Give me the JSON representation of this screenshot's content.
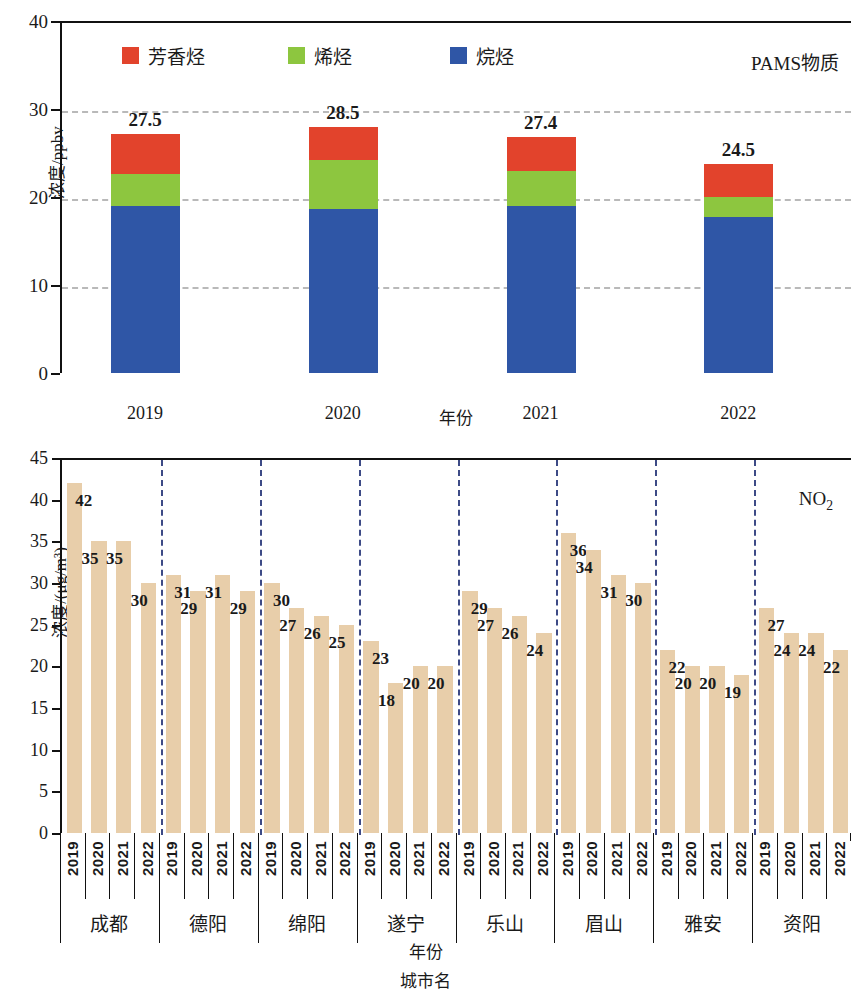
{
  "colors": {
    "aromatic": "#e2432c",
    "alkene": "#8dc63f",
    "alkane": "#2f56a6",
    "no2_bar": "#e8ceaa",
    "separator": "#3d4a86",
    "gridline": "#b9b9b9",
    "axis": "#111111"
  },
  "chart_data": [
    {
      "type": "bar",
      "subtype": "stacked",
      "title": "",
      "annotation": "PAMS物质",
      "xlabel": "年份",
      "ylabel": "浓度/ppbv",
      "ylim": [
        0,
        40
      ],
      "yticks": [
        0,
        10,
        20,
        30,
        40
      ],
      "ytick_labels": [
        "0",
        "10",
        "20",
        "30",
        "40"
      ],
      "grid": "horizontal dashed at 10, 20, 30",
      "legend_position": "top-left inside",
      "categories": [
        "2019",
        "2020",
        "2021",
        "2022"
      ],
      "series": [
        {
          "name": "烷烃",
          "color": "#2f56a6",
          "values": [
            19.0,
            18.6,
            19.0,
            17.7
          ]
        },
        {
          "name": "烯烃",
          "color": "#8dc63f",
          "values": [
            3.6,
            5.6,
            4.0,
            2.3
          ]
        },
        {
          "name": "芳香烃",
          "color": "#e2432c",
          "values": [
            4.6,
            3.8,
            3.8,
            3.8
          ]
        }
      ],
      "totals": [
        27.5,
        28.5,
        27.4,
        24.5
      ],
      "total_labels": [
        "27.5",
        "28.5",
        "27.4",
        "24.5"
      ]
    },
    {
      "type": "bar",
      "subtype": "grouped-by-city",
      "title": "",
      "annotation": "NO₂",
      "xlabel": "年份",
      "xlabel2": "城市名",
      "ylabel": "浓度/(μg/m³)",
      "ylim": [
        0,
        45
      ],
      "yticks": [
        0,
        5,
        10,
        15,
        20,
        25,
        30,
        35,
        40,
        45
      ],
      "ytick_labels": [
        "0",
        "5",
        "10",
        "15",
        "20",
        "25",
        "30",
        "35",
        "40",
        "45"
      ],
      "grid": "none",
      "years": [
        "2019",
        "2020",
        "2021",
        "2022"
      ],
      "cities": [
        "成都",
        "德阳",
        "绵阳",
        "遂宁",
        "乐山",
        "眉山",
        "雅安",
        "资阳"
      ],
      "groups": [
        {
          "city": "成都",
          "values": [
            42,
            35,
            35,
            30
          ],
          "labels": [
            "42",
            "35",
            "35",
            "30"
          ]
        },
        {
          "city": "德阳",
          "values": [
            31,
            29,
            31,
            29
          ],
          "labels": [
            "31",
            "29",
            "31",
            "29"
          ]
        },
        {
          "city": "绵阳",
          "values": [
            30,
            27,
            26,
            25
          ],
          "labels": [
            "30",
            "27",
            "26",
            "25"
          ]
        },
        {
          "city": "遂宁",
          "values": [
            23,
            18,
            20,
            20
          ],
          "labels": [
            "23",
            "18",
            "20",
            "20"
          ]
        },
        {
          "city": "乐山",
          "values": [
            29,
            27,
            26,
            24
          ],
          "labels": [
            "29",
            "27",
            "26",
            "24"
          ]
        },
        {
          "city": "眉山",
          "values": [
            36,
            34,
            31,
            30
          ],
          "labels": [
            "36",
            "34",
            "31",
            "30"
          ]
        },
        {
          "city": "雅安",
          "values": [
            22,
            20,
            20,
            19
          ],
          "labels": [
            "22",
            "20",
            "20",
            "19"
          ]
        },
        {
          "city": "资阳",
          "values": [
            27,
            24,
            24,
            22
          ],
          "labels": [
            "27",
            "24",
            "24",
            "22"
          ]
        }
      ]
    }
  ]
}
